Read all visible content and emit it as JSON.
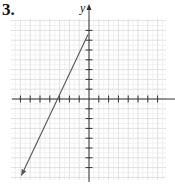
{
  "problem_number": "3.",
  "chart_data": {
    "type": "line",
    "title": "",
    "xlabel": "",
    "ylabel": "y",
    "grid": true,
    "xlim": [
      -8,
      8
    ],
    "ylim": [
      -8,
      8
    ],
    "tick_spacing": 1,
    "x_ticks": [
      -7,
      -6,
      -5,
      -4,
      -3,
      -2,
      -1,
      1,
      2,
      3,
      4,
      5,
      6,
      7
    ],
    "y_ticks": [
      -7,
      -6,
      -5,
      -4,
      -3,
      -2,
      -1,
      1,
      2,
      3,
      4,
      5,
      6,
      7
    ],
    "series": [
      {
        "name": "line",
        "equation": "y = 2x + 7",
        "x": [
          0,
          -7
        ],
        "y": [
          7,
          -7
        ],
        "arrows": [
          "end"
        ],
        "x_intercept": -3.5,
        "y_intercept": 7
      }
    ]
  },
  "colors": {
    "grid": "#d4d4d4",
    "axis": "#333333",
    "line": "#555555"
  }
}
